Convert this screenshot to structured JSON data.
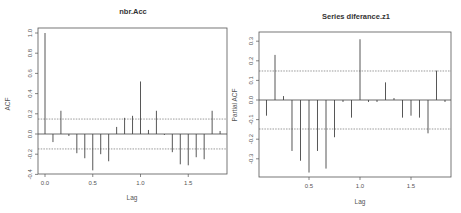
{
  "chart_data": [
    {
      "type": "bar",
      "title": "nbr.Acc",
      "xlabel": "Lag",
      "ylabel": "ACF",
      "ylim": [
        -0.4,
        1.0
      ],
      "xlim": [
        0,
        1.83
      ],
      "xticks": [
        "0.0",
        "0.5",
        "1.0",
        "1.5"
      ],
      "yticks": [
        "-0.4",
        "-0.2",
        "0.0",
        "0.2",
        "0.4",
        "0.6",
        "0.8",
        "1.0"
      ],
      "conf_bound": 0.148,
      "grid": false,
      "x": [
        0,
        0.0833,
        0.1667,
        0.25,
        0.3333,
        0.4167,
        0.5,
        0.5833,
        0.6667,
        0.75,
        0.8333,
        0.9167,
        1.0,
        1.0833,
        1.1667,
        1.25,
        1.3333,
        1.4167,
        1.5,
        1.5833,
        1.6667,
        1.75,
        1.8333
      ],
      "values": [
        1.0,
        -0.08,
        0.23,
        -0.02,
        -0.19,
        -0.24,
        -0.36,
        -0.2,
        -0.27,
        0.07,
        0.16,
        0.18,
        0.52,
        0.04,
        0.23,
        -0.01,
        -0.18,
        -0.3,
        -0.31,
        -0.23,
        -0.25,
        0.23,
        0.03
      ]
    },
    {
      "type": "bar",
      "title": "Series diferance.z1",
      "xlabel": "Lag",
      "ylabel": "Partial ACF",
      "ylim": [
        -0.4,
        0.33
      ],
      "xlim": [
        0.0833,
        1.83
      ],
      "xticks": [
        "0.5",
        "1.0",
        "1.5"
      ],
      "yticks": [
        "-0.3",
        "-0.2",
        "-0.1",
        "0.0",
        "0.1",
        "0.2",
        "0.3"
      ],
      "conf_bound": 0.148,
      "grid": false,
      "x": [
        0.0833,
        0.1667,
        0.25,
        0.3333,
        0.4167,
        0.5,
        0.5833,
        0.6667,
        0.75,
        0.8333,
        0.9167,
        1.0,
        1.0833,
        1.1667,
        1.25,
        1.3333,
        1.4167,
        1.5,
        1.5833,
        1.6667,
        1.75,
        1.8333
      ],
      "values": [
        -0.08,
        0.23,
        0.02,
        -0.26,
        -0.31,
        -0.37,
        -0.26,
        -0.35,
        -0.19,
        -0.01,
        -0.09,
        0.31,
        -0.01,
        -0.01,
        0.09,
        0.01,
        -0.09,
        -0.08,
        -0.09,
        -0.17,
        0.15,
        -0.01
      ]
    }
  ],
  "panels": {
    "left": {
      "title": "nbr.Acc",
      "xlabel": "Lag",
      "ylabel": "ACF"
    },
    "right": {
      "title": "Series diferance.z1",
      "xlabel": "Lag",
      "ylabel": "Partial ACF"
    }
  },
  "colors": {
    "bar": "#444444",
    "frame": "#555555",
    "conf": "#555555",
    "text": "#333333"
  }
}
